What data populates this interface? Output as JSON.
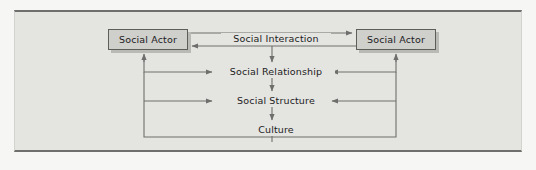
{
  "figure": {
    "type": "flow-diagram",
    "title": "",
    "background_color": "#e4e4e1",
    "line_color": "#6e6e6c",
    "box_fill_color": "#cfcfcc",
    "box_border_color": "#5d5d5b",
    "text_color": "#1c1c1c"
  },
  "nodes": {
    "actor_left": {
      "label": "Social Actor",
      "shape": "box"
    },
    "actor_right": {
      "label": "Social Actor",
      "shape": "box"
    },
    "interaction": {
      "label": "Social Interaction",
      "shape": "text"
    },
    "relationship": {
      "label": "Social Relationship",
      "shape": "text"
    },
    "structure": {
      "label": "Social Structure",
      "shape": "text"
    },
    "culture": {
      "label": "Culture",
      "shape": "text"
    }
  },
  "edges": [
    {
      "from": "actor_left",
      "to": "actor_right",
      "label": "Social Interaction",
      "direction": "right"
    },
    {
      "from": "actor_right",
      "to": "actor_left",
      "label": "Social Interaction",
      "direction": "left"
    },
    {
      "from": "interaction",
      "to": "relationship",
      "direction": "down"
    },
    {
      "from": "relationship",
      "to": "structure",
      "direction": "down"
    },
    {
      "from": "structure",
      "to": "culture",
      "direction": "down"
    },
    {
      "from": "actor_left",
      "to": "relationship",
      "direction": "right"
    },
    {
      "from": "actor_right",
      "to": "relationship",
      "direction": "left"
    },
    {
      "from": "actor_left",
      "to": "structure",
      "direction": "right"
    },
    {
      "from": "actor_right",
      "to": "structure",
      "direction": "left"
    },
    {
      "from": "culture",
      "to": "actor_left",
      "direction": "up"
    },
    {
      "from": "culture",
      "to": "actor_right",
      "direction": "up"
    }
  ]
}
